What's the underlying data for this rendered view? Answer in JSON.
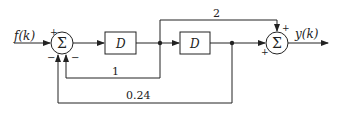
{
  "diagram": {
    "input_label": "f(k)",
    "output_label": "y(k)",
    "sum1": {
      "symbol": "Σ",
      "signs": {
        "input": "+",
        "fb1": "−",
        "fb2": "−"
      }
    },
    "sum2": {
      "symbol": "Σ",
      "signs": {
        "top": "+",
        "left": "+"
      }
    },
    "delay1": {
      "label": "D"
    },
    "delay2": {
      "label": "D"
    },
    "gains": {
      "forward": "2",
      "feedback1": "1",
      "feedback2": "0.24"
    },
    "line_color": "#222222"
  }
}
